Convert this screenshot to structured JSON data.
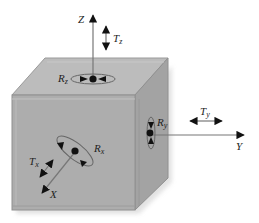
{
  "diagram": {
    "type": "six-degrees-of-freedom",
    "colors": {
      "top_face": "#b9b9b9",
      "front_face": "#ababab",
      "right_face": "#a2a2a2",
      "edge": "#8f8f8f",
      "axis": "#777777",
      "arrow": "#111111"
    },
    "axes": {
      "z": {
        "label": "Z"
      },
      "y": {
        "label": "Y"
      },
      "x": {
        "label": "X"
      }
    },
    "translations": {
      "z": {
        "base": "T",
        "sub": "z"
      },
      "y": {
        "base": "T",
        "sub": "y"
      },
      "x": {
        "base": "T",
        "sub": "x"
      }
    },
    "rotations": {
      "z": {
        "base": "R",
        "sub": "z"
      },
      "y": {
        "base": "R",
        "sub": "y"
      },
      "x": {
        "base": "R",
        "sub": "x"
      }
    }
  }
}
